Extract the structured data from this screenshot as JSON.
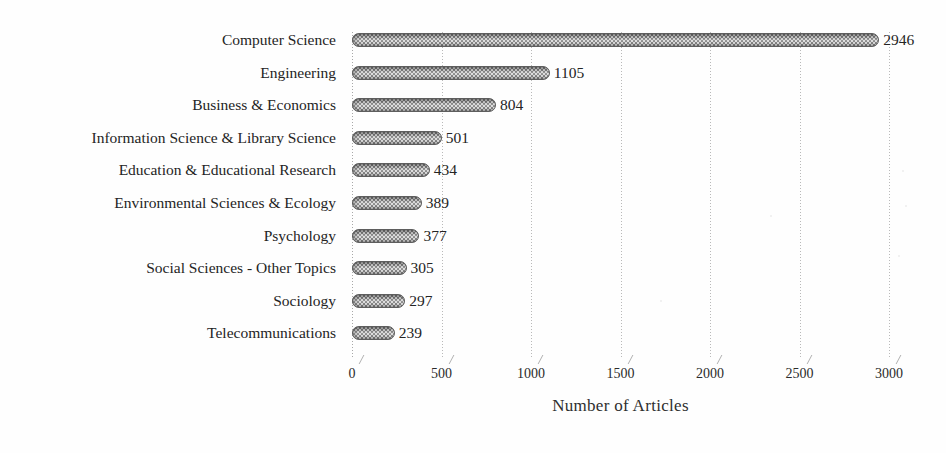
{
  "chart_data": {
    "type": "bar",
    "orientation": "horizontal",
    "title": "",
    "xlabel": "Number of Articles",
    "ylabel": "Subject Categories",
    "categories": [
      "Computer Science",
      "Engineering",
      "Business & Economics",
      "Information Science & Library Science",
      "Education & Educational Research",
      "Environmental Sciences & Ecology",
      "Psychology",
      "Social Sciences - Other Topics",
      "Sociology",
      "Telecommunications"
    ],
    "values": [
      2946,
      1105,
      804,
      501,
      434,
      389,
      377,
      305,
      297,
      239
    ],
    "value_labels": [
      "2946",
      "1105",
      "804",
      "501",
      "434",
      "389",
      "377",
      "305",
      "297",
      "239"
    ],
    "xlim": [
      0,
      3000
    ],
    "xticks": [
      0,
      500,
      1000,
      1500,
      2000,
      2500,
      3000
    ],
    "xtick_labels": [
      "0",
      "500",
      "1000",
      "1500",
      "2000",
      "2500",
      "3000"
    ],
    "grid": "vertical-dotted",
    "legend": "none",
    "bar_fill": "#9a9a9a",
    "bar_pattern": "50%-checkerboard-dither",
    "bar_border": "#5e5e5e",
    "gridline_color": "#b9b9b9",
    "text_color": "#242424",
    "background": "#fefefe"
  }
}
